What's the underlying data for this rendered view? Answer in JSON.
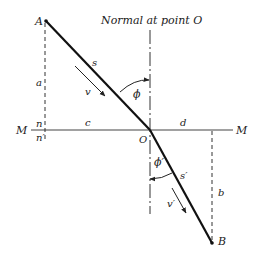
{
  "diagram": {
    "normal_label": "Normal at point O",
    "surface_label_left": "M",
    "surface_label_right": "M",
    "points": {
      "A": {
        "label": "A",
        "x": 46,
        "y": 21
      },
      "O": {
        "label": "O",
        "x": 150,
        "y": 130
      },
      "B": {
        "label": "B",
        "x": 212,
        "y": 243
      }
    },
    "labels": {
      "a": "a",
      "b": "b",
      "c": "c",
      "d": "d",
      "n": "n",
      "n_prime": "n′",
      "s": "s",
      "s_prime": "s′",
      "v": "v",
      "v_prime": "v′",
      "phi": "ϕ",
      "phi_prime": "ϕ′"
    },
    "colors": {
      "line": "#222222",
      "text": "#222222"
    }
  }
}
